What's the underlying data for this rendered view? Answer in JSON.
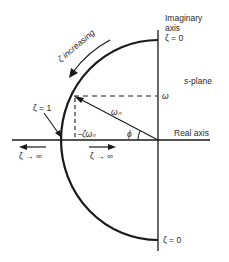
{
  "figure": {
    "type": "s-plane root locus (constant natural frequency, varying damping ratio)",
    "labels": {
      "imaginary_axis_line1": "Imaginary",
      "imaginary_axis_line2": "axis",
      "zeta_zero_top": "ζ = 0",
      "zeta_zero_bottom": "ζ = 0",
      "s_plane_italic": "s",
      "s_plane_rest": "-plane",
      "omega": "ω",
      "real_axis": "Real axis",
      "omega_n": "ωₙ",
      "phi": "ϕ",
      "minus_zeta_omega_n": "−ζωₙ",
      "zeta_one": "ζ = 1",
      "zeta_increasing": "ζ increasing",
      "zeta_to_inf_left": "ζ → ∞",
      "zeta_to_inf_right": "ζ → ∞"
    },
    "geometry": {
      "origin": [
        158,
        140
      ],
      "radius": 95,
      "pole": [
        73,
        97
      ],
      "real_axis_x_range": [
        12,
        210
      ],
      "imag_axis_y_range": [
        30,
        250
      ]
    },
    "colors": {
      "line": "#1a1a1a",
      "background": "#ffffff"
    }
  }
}
